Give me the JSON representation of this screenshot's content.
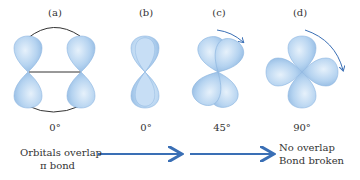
{
  "panels": [
    {
      "label": "(a)",
      "angle": "0°"
    },
    {
      "label": "(b)",
      "angle": "0°"
    },
    {
      "label": "(c)",
      "angle": "45°"
    },
    {
      "label": "(d)",
      "angle": "90°"
    }
  ],
  "caption": {
    "left_line1": "Orbitals overlap",
    "left_line2": "π bond",
    "right_line1": "No overlap",
    "right_line2": "Bond broken"
  },
  "colors": {
    "lobe_fill": "#b5d3f0",
    "lobe_stroke": "#7fa8d4",
    "arrow": "#3a6fb5",
    "line": "#333333"
  }
}
